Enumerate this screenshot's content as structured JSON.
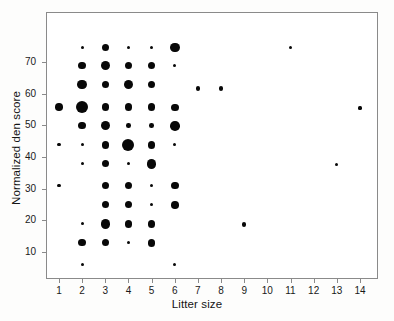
{
  "chart_data": {
    "type": "scatter",
    "subtype": "bubble",
    "title": "",
    "xlabel": "Litter size",
    "ylabel": "Normalized den score",
    "xlim": [
      0.3,
      14.7
    ],
    "ylim": [
      2.5,
      78
    ],
    "grid": false,
    "legend": null,
    "xticks": [
      1,
      2,
      3,
      4,
      5,
      6,
      7,
      8,
      9,
      10,
      11,
      12,
      13,
      14
    ],
    "xtick_labels": [
      "1",
      "2",
      "3",
      "4",
      "5",
      "6",
      "7",
      "8",
      "9",
      "10",
      "11",
      "12",
      "13",
      "14"
    ],
    "yticks": [
      10,
      20,
      30,
      40,
      50,
      60,
      70
    ],
    "ytick_labels": [
      "10",
      "20",
      "30",
      "40",
      "50",
      "60",
      "70"
    ],
    "marker_color": "#080808",
    "frame_color": "#8a8a8a",
    "size_encodes": "count of observations",
    "points": [
      {
        "x": 2,
        "y": 74.5,
        "size": 1
      },
      {
        "x": 3,
        "y": 74.5,
        "size": 3
      },
      {
        "x": 4,
        "y": 74.5,
        "size": 1
      },
      {
        "x": 5,
        "y": 74.5,
        "size": 1
      },
      {
        "x": 6,
        "y": 74.5,
        "size": 4
      },
      {
        "x": 11,
        "y": 74.5,
        "size": 1
      },
      {
        "x": 2,
        "y": 68.8,
        "size": 3
      },
      {
        "x": 3,
        "y": 68.8,
        "size": 4
      },
      {
        "x": 4,
        "y": 68.8,
        "size": 3
      },
      {
        "x": 5,
        "y": 68.8,
        "size": 3
      },
      {
        "x": 6,
        "y": 68.8,
        "size": 1
      },
      {
        "x": 2,
        "y": 62.8,
        "size": 4
      },
      {
        "x": 3,
        "y": 62.8,
        "size": 3
      },
      {
        "x": 4,
        "y": 62.8,
        "size": 4
      },
      {
        "x": 5,
        "y": 62.8,
        "size": 3
      },
      {
        "x": 7,
        "y": 61.6,
        "size": 2
      },
      {
        "x": 8,
        "y": 61.6,
        "size": 2
      },
      {
        "x": 1,
        "y": 55.8,
        "size": 3
      },
      {
        "x": 2,
        "y": 55.8,
        "size": 5
      },
      {
        "x": 3,
        "y": 55.8,
        "size": 3
      },
      {
        "x": 4,
        "y": 55.8,
        "size": 3
      },
      {
        "x": 5,
        "y": 55.8,
        "size": 3
      },
      {
        "x": 6,
        "y": 55.6,
        "size": 3
      },
      {
        "x": 14,
        "y": 55.4,
        "size": 1
      },
      {
        "x": 2,
        "y": 49.9,
        "size": 3
      },
      {
        "x": 3,
        "y": 49.9,
        "size": 4
      },
      {
        "x": 4,
        "y": 49.9,
        "size": 2
      },
      {
        "x": 5,
        "y": 49.9,
        "size": 2
      },
      {
        "x": 6,
        "y": 49.7,
        "size": 4
      },
      {
        "x": 1,
        "y": 43.8,
        "size": 1
      },
      {
        "x": 2,
        "y": 43.8,
        "size": 1
      },
      {
        "x": 3,
        "y": 43.8,
        "size": 3
      },
      {
        "x": 4,
        "y": 43.7,
        "size": 5
      },
      {
        "x": 5,
        "y": 43.8,
        "size": 3
      },
      {
        "x": 6,
        "y": 43.8,
        "size": 1
      },
      {
        "x": 2,
        "y": 37.9,
        "size": 1
      },
      {
        "x": 3,
        "y": 37.9,
        "size": 3
      },
      {
        "x": 4,
        "y": 37.9,
        "size": 1
      },
      {
        "x": 5,
        "y": 37.7,
        "size": 4
      },
      {
        "x": 13,
        "y": 37.5,
        "size": 1
      },
      {
        "x": 1,
        "y": 31.0,
        "size": 1
      },
      {
        "x": 3,
        "y": 31.0,
        "size": 3
      },
      {
        "x": 4,
        "y": 31.0,
        "size": 3
      },
      {
        "x": 5,
        "y": 30.9,
        "size": 1
      },
      {
        "x": 6,
        "y": 31.0,
        "size": 3
      },
      {
        "x": 3,
        "y": 25.0,
        "size": 3
      },
      {
        "x": 4,
        "y": 25.0,
        "size": 3
      },
      {
        "x": 5,
        "y": 25.0,
        "size": 1
      },
      {
        "x": 6,
        "y": 24.8,
        "size": 3
      },
      {
        "x": 2,
        "y": 19.0,
        "size": 1
      },
      {
        "x": 3,
        "y": 18.8,
        "size": 4
      },
      {
        "x": 4,
        "y": 18.8,
        "size": 3
      },
      {
        "x": 5,
        "y": 18.8,
        "size": 3
      },
      {
        "x": 9,
        "y": 18.7,
        "size": 2
      },
      {
        "x": 2,
        "y": 13.0,
        "size": 3
      },
      {
        "x": 3,
        "y": 13.0,
        "size": 3
      },
      {
        "x": 4,
        "y": 13.0,
        "size": 1
      },
      {
        "x": 5,
        "y": 12.9,
        "size": 3
      },
      {
        "x": 2,
        "y": 6.0,
        "size": 1
      },
      {
        "x": 6,
        "y": 6.0,
        "size": 1
      }
    ]
  },
  "plot": {
    "frame": {
      "left": 46,
      "top": 12,
      "width": 332,
      "height": 267
    },
    "x_axis": {
      "x_at_1": 59.0,
      "x_step": 23.15
    },
    "y_axis": {
      "y_at_10": 252.0,
      "y_per_unit": 3.17
    },
    "size_px": {
      "1": 3.2,
      "2": 4.6,
      "3": 7.6,
      "4": 9.6,
      "5": 12.0
    }
  }
}
